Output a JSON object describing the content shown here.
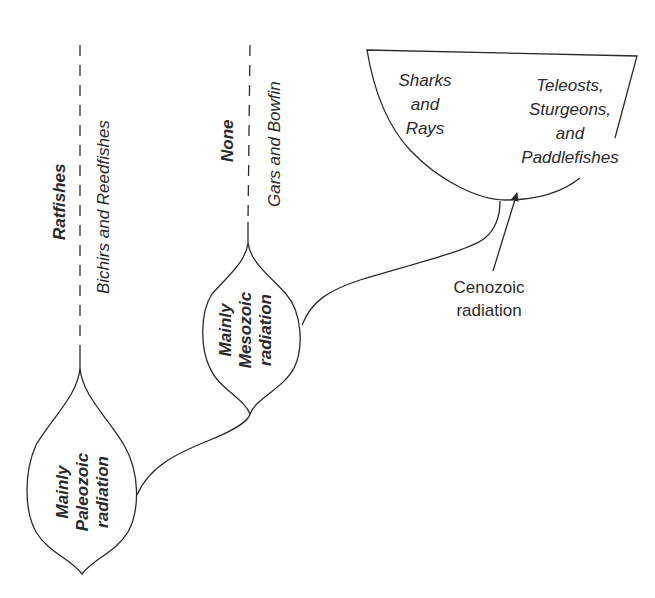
{
  "diagram": {
    "lineages": [
      {
        "id": "paleozoic",
        "radiation_label": [
          "Mainly",
          "Paleozoic",
          "radiation"
        ],
        "extinct_group_label": "Ratfishes",
        "living_group_label": "Bichirs and Reedfishes"
      },
      {
        "id": "mesozoic",
        "radiation_label": [
          "Mainly",
          "Mesozoic",
          "radiation"
        ],
        "extinct_group_label": "None",
        "living_group_label": "Gars and Bowfin"
      },
      {
        "id": "cenozoic",
        "bowl_groups": [
          {
            "lines": [
              "Sharks",
              "and",
              "Rays"
            ]
          },
          {
            "lines": [
              "Teleosts,",
              "Sturgeons,",
              "and",
              "Paddlefishes"
            ]
          }
        ],
        "annotation_lines": [
          "Cenozoic",
          "radiation"
        ]
      }
    ],
    "colors": {
      "line": "#2a2a2a",
      "background": "#ffffff"
    }
  }
}
